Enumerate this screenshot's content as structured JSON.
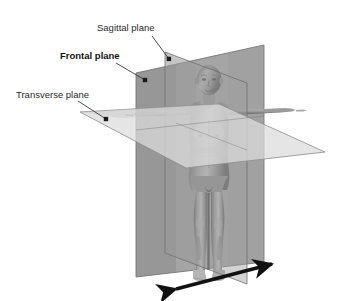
{
  "figure": {
    "width": 346,
    "height": 301,
    "background_color": "#ffffff"
  },
  "labels": [
    {
      "id": "sagittal",
      "text": "Sagittal plane",
      "bold": false,
      "text_x": 97,
      "text_y": 31,
      "leader_from_x": 152,
      "leader_from_y": 36,
      "leader_to_x": 169,
      "leader_to_y": 59,
      "dot_x": 169,
      "dot_y": 59,
      "color": "#2b2b2b"
    },
    {
      "id": "frontal",
      "text": "Frontal plane",
      "bold": true,
      "text_x": 60,
      "text_y": 59,
      "leader_from_x": 116,
      "leader_from_y": 63,
      "leader_to_x": 145,
      "leader_to_y": 80,
      "dot_x": 145,
      "dot_y": 80,
      "color": "#121212"
    },
    {
      "id": "transverse",
      "text": "Transverse plane",
      "bold": false,
      "text_x": 16,
      "text_y": 98,
      "leader_from_x": 78,
      "leader_from_y": 101,
      "leader_to_x": 106,
      "leader_to_y": 119,
      "dot_x": 106,
      "dot_y": 119,
      "color": "#2b2b2b"
    }
  ],
  "planes": [
    {
      "id": "frontal-plane",
      "name": "frontal plane",
      "description": "large vertical coronal parallelogram passing side to side through the body",
      "points": "136,73 264,45 264,262 136,277",
      "fill": "#8b8b8b",
      "opacity": 0.78,
      "stroke": "#6d6d6d"
    },
    {
      "id": "sagittal-plane",
      "name": "sagittal plane",
      "description": "vertical median parallelogram dividing body into left and right halves",
      "points": "165,52 247,83 247,284 165,253",
      "fill": "#9a9a9a",
      "opacity": 0.5,
      "stroke": "#707070"
    },
    {
      "id": "transverse-plane",
      "name": "transverse plane",
      "description": "horizontal plane dividing body into superior and inferior parts",
      "points": "80,112 219,104 325,152 186,168",
      "fill": "#d8d8d8",
      "opacity": 0.72,
      "stroke": "#8a8a8a"
    }
  ],
  "body_figure": {
    "id": "human-figure",
    "pose": "T-pose standing female anatomical model",
    "skin_color": "#9d9d9d",
    "shadow_color": "#6a6a6a",
    "highlight_color": "#c4c4c4"
  },
  "arrow": {
    "id": "rotation-axis-arrow",
    "description": "double headed arrow along the ground indicating axis direction",
    "start_x": 176,
    "start_y": 289,
    "end_x": 272,
    "end_y": 264,
    "color": "#111111",
    "line_width": 3.2,
    "head_length": 15,
    "head_width": 11
  }
}
